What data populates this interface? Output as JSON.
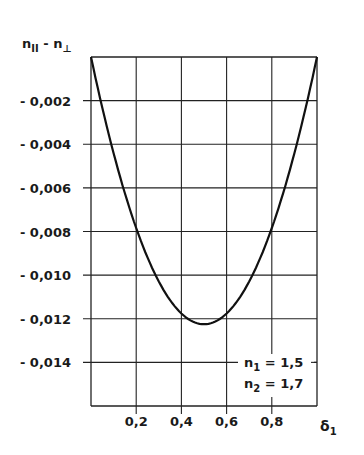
{
  "chart_data": {
    "type": "line",
    "title": "",
    "ylabel": "n‖ − n⊥",
    "ylabel_main": "n",
    "ylabel_sub1": "II",
    "ylabel_mid": " - n",
    "ylabel_sub2": "⊥",
    "xlabel": "δ1",
    "xlabel_main": "δ",
    "xlabel_sub": "1",
    "xlim": [
      0,
      1.0
    ],
    "ylim": [
      -0.016,
      0
    ],
    "grid": true,
    "x_ticks": [
      "0,2",
      "0,4",
      "0,6",
      "0,8"
    ],
    "y_ticks": [
      "- 0,002",
      "- 0,004",
      "- 0,006",
      "- 0,008",
      "- 0,010",
      "- 0,012",
      "- 0,014"
    ],
    "series": [
      {
        "name": "n1 = 1,5, n2 = 1,7",
        "x": [
          0.0,
          0.1,
          0.2,
          0.3,
          0.4,
          0.5,
          0.6,
          0.7,
          0.8,
          0.9,
          1.0
        ],
        "y": [
          0.0,
          -0.0044,
          -0.0078,
          -0.0103,
          -0.0118,
          -0.0123,
          -0.0118,
          -0.0103,
          -0.0078,
          -0.0044,
          0.0
        ]
      }
    ],
    "annotations": [
      {
        "main": "n",
        "sub": "1",
        "text": " = 1,5"
      },
      {
        "main": "n",
        "sub": "2",
        "text": " = 1,7"
      }
    ]
  }
}
